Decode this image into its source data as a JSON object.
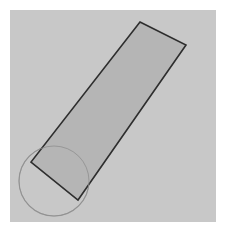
{
  "canvas": {
    "width": 226,
    "height": 232,
    "outer_background": "#ffffff",
    "title": "Rotated rectangle with overlapping circle"
  },
  "panel": {
    "name": "drawing-panel",
    "x": 10,
    "y": 10,
    "width": 206,
    "height": 212,
    "fill": "#c8c8c8",
    "stroke": "#c0c0c0",
    "stroke_width": 0
  },
  "shapes": [
    {
      "id": "rotated-rectangle",
      "type": "polygon",
      "label": "Rotated rectangle",
      "points": "140,22 186,45 78,200 31,162",
      "fill": "#b3b3b3",
      "stroke": "#2e2e2e",
      "stroke_width": 1.6,
      "fill_opacity": 1,
      "vertices": [
        {
          "name": "top-vertex",
          "x": 140,
          "y": 22
        },
        {
          "name": "right-vertex",
          "x": 186,
          "y": 45
        },
        {
          "name": "bottom-vertex",
          "x": 78,
          "y": 200
        },
        {
          "name": "left-vertex",
          "x": 31,
          "y": 162
        }
      ]
    },
    {
      "id": "overlap-circle",
      "type": "circle",
      "label": "Circle",
      "cx": 54,
      "cy": 181,
      "r": 35,
      "fill": "none",
      "stroke": "#9b9b9b",
      "stroke_width": 1.1
    }
  ],
  "chart_data": {
    "type": "diagram",
    "elements": [
      {
        "shape": "rectangle",
        "orientation_degrees": -55,
        "vertices": [
          [
            140,
            22
          ],
          [
            186,
            45
          ],
          [
            78,
            200
          ],
          [
            31,
            162
          ]
        ],
        "approx_width_px": 51,
        "approx_length_px": 188,
        "fill": "#b3b3b3",
        "stroke": "#2e2e2e"
      },
      {
        "shape": "circle",
        "center": [
          54,
          181
        ],
        "radius_px": 35,
        "fill": "none",
        "stroke": "#9b9b9b"
      }
    ],
    "background": "#c8c8c8"
  }
}
